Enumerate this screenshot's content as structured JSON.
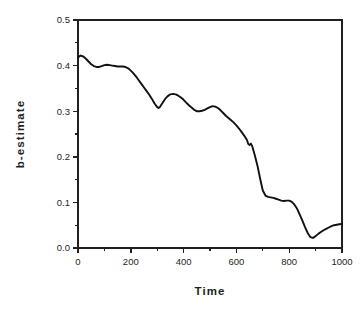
{
  "chart_data": {
    "type": "line",
    "title": "",
    "xlabel": "Time",
    "ylabel": "b-estimate",
    "xlim": [
      0,
      1000
    ],
    "ylim": [
      0.0,
      0.5
    ],
    "grid": false,
    "legend": false,
    "x_ticks": [
      0,
      200,
      400,
      600,
      800,
      1000
    ],
    "x_tick_labels": [
      "0",
      "200",
      "400",
      "600",
      "800",
      "1000"
    ],
    "x_minor_ticks": [
      100,
      300,
      500,
      700,
      900
    ],
    "y_ticks": [
      0.0,
      0.1,
      0.2,
      0.3,
      0.4,
      0.5
    ],
    "y_tick_labels": [
      "0.0",
      "0.1",
      "0.2",
      "0.3",
      "0.4",
      "0.5"
    ],
    "y_minor_ticks": [
      0.05,
      0.15,
      0.25,
      0.35,
      0.45
    ],
    "series": [
      {
        "name": "b-estimate",
        "color": "#111111",
        "x": [
          0,
          10,
          20,
          30,
          40,
          50,
          60,
          70,
          80,
          90,
          100,
          110,
          120,
          130,
          140,
          150,
          160,
          170,
          180,
          190,
          200,
          210,
          220,
          230,
          240,
          250,
          260,
          270,
          280,
          290,
          300,
          305,
          310,
          320,
          330,
          340,
          350,
          360,
          370,
          380,
          390,
          400,
          410,
          420,
          430,
          440,
          450,
          460,
          470,
          480,
          490,
          500,
          510,
          520,
          530,
          540,
          550,
          560,
          570,
          580,
          590,
          600,
          610,
          620,
          630,
          640,
          645,
          650,
          655,
          660,
          670,
          680,
          690,
          700,
          710,
          720,
          730,
          740,
          750,
          760,
          770,
          780,
          790,
          800,
          810,
          820,
          830,
          840,
          850,
          860,
          870,
          880,
          890,
          900,
          910,
          920,
          930,
          940,
          950,
          960,
          970,
          980,
          990,
          1000
        ],
        "y": [
          0.418,
          0.422,
          0.42,
          0.415,
          0.409,
          0.403,
          0.399,
          0.397,
          0.397,
          0.399,
          0.401,
          0.402,
          0.401,
          0.4,
          0.399,
          0.398,
          0.398,
          0.398,
          0.397,
          0.394,
          0.389,
          0.383,
          0.376,
          0.368,
          0.36,
          0.352,
          0.344,
          0.336,
          0.327,
          0.317,
          0.309,
          0.307,
          0.309,
          0.318,
          0.327,
          0.333,
          0.337,
          0.338,
          0.337,
          0.334,
          0.33,
          0.325,
          0.319,
          0.313,
          0.308,
          0.303,
          0.3,
          0.3,
          0.301,
          0.303,
          0.306,
          0.309,
          0.311,
          0.31,
          0.307,
          0.302,
          0.296,
          0.29,
          0.285,
          0.28,
          0.275,
          0.269,
          0.262,
          0.254,
          0.246,
          0.237,
          0.228,
          0.226,
          0.229,
          0.223,
          0.203,
          0.18,
          0.152,
          0.126,
          0.115,
          0.112,
          0.111,
          0.11,
          0.108,
          0.106,
          0.104,
          0.103,
          0.104,
          0.104,
          0.101,
          0.095,
          0.086,
          0.073,
          0.06,
          0.046,
          0.033,
          0.024,
          0.022,
          0.026,
          0.031,
          0.035,
          0.039,
          0.042,
          0.045,
          0.048,
          0.05,
          0.051,
          0.052,
          0.053
        ]
      }
    ]
  },
  "plot_geometry": {
    "left": 78,
    "right": 342,
    "top": 20,
    "bottom": 248
  }
}
